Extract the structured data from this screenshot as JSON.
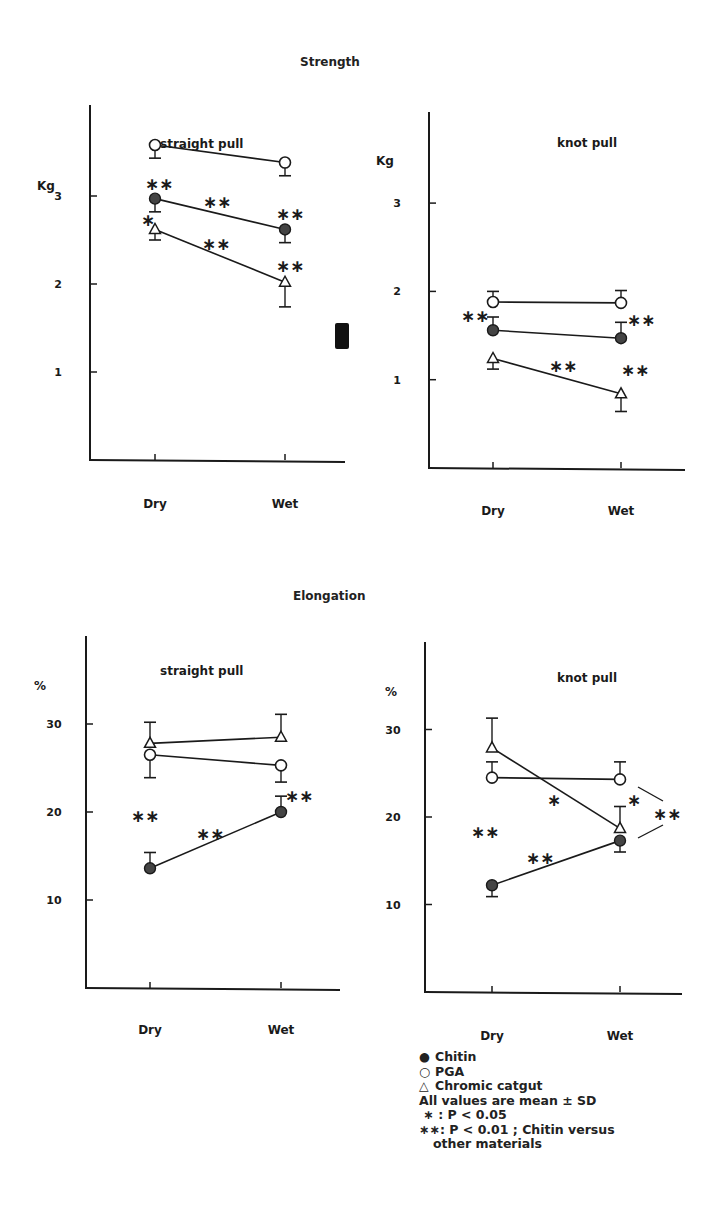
{
  "figure": {
    "sections": [
      {
        "title": "Strength",
        "title_pos": [
          300,
          55
        ]
      },
      {
        "title": "Elongation",
        "title_pos": [
          293,
          589
        ]
      }
    ],
    "artifact": {
      "type": "black-square",
      "x": 335,
      "y": 323,
      "w": 14,
      "h": 26
    }
  },
  "legend": {
    "items": [
      {
        "symbol": "●",
        "label": "Chitin"
      },
      {
        "symbol": "○",
        "label": "PGA"
      },
      {
        "symbol": "△",
        "label": "Chromic catgut"
      }
    ],
    "notes": [
      "All values are mean ± SD",
      " ∗ : P < 0.05",
      "∗∗: P < 0.01 ; Chitin versus",
      "other materials"
    ]
  },
  "colors": {
    "ink": "#1a1a1a",
    "background": "#ffffff"
  },
  "chart_data": [
    {
      "type": "line",
      "section": "Strength",
      "title": "straight pull",
      "ylabel": "Kg",
      "categories": [
        "Dry",
        "Wet"
      ],
      "yticks": [
        1,
        2,
        3
      ],
      "ylim": [
        0,
        4
      ],
      "grid": false,
      "series": [
        {
          "name": "PGA",
          "marker": "open-circle",
          "values": [
            3.58,
            3.38
          ],
          "sd": [
            0.15,
            0.15
          ],
          "sd_dir": "down"
        },
        {
          "name": "Chitin",
          "marker": "filled-circle",
          "values": [
            2.97,
            2.62
          ],
          "sd": [
            0.15,
            0.15
          ],
          "sd_dir": "down"
        },
        {
          "name": "Chromic catgut",
          "marker": "open-triangle",
          "values": [
            2.62,
            2.02
          ],
          "sd": [
            0.12,
            0.28
          ],
          "sd_dir": "down"
        }
      ],
      "annotations": [
        {
          "text": "∗∗",
          "x": 145,
          "y": 190
        },
        {
          "text": "∗∗",
          "x": 203,
          "y": 208
        },
        {
          "text": "∗∗",
          "x": 276,
          "y": 220
        },
        {
          "text": "∗",
          "x": 141,
          "y": 226
        },
        {
          "text": "∗∗",
          "x": 202,
          "y": 250
        },
        {
          "text": "∗∗",
          "x": 276,
          "y": 272
        }
      ],
      "frame": {
        "axis_x": 90,
        "y_top": 105,
        "y_zero": 460,
        "x_end": 345,
        "x_dry": 155,
        "x_wet": 285,
        "px_per_unit": 88,
        "title_x": 160,
        "title_y": 148,
        "ylabel_x": 37,
        "ylabel_y": 190,
        "cat_y": 508
      }
    },
    {
      "type": "line",
      "section": "Strength",
      "title": "knot pull",
      "ylabel": "Kg",
      "categories": [
        "Dry",
        "Wet"
      ],
      "yticks": [
        1,
        2,
        3
      ],
      "ylim": [
        0,
        4
      ],
      "grid": false,
      "series": [
        {
          "name": "PGA",
          "marker": "open-circle",
          "values": [
            1.88,
            1.87
          ],
          "sd": [
            0.12,
            0.14
          ],
          "sd_dir": "up"
        },
        {
          "name": "Chitin",
          "marker": "filled-circle",
          "values": [
            1.56,
            1.47
          ],
          "sd": [
            0.15,
            0.18
          ],
          "sd_dir": "up"
        },
        {
          "name": "Chromic catgut",
          "marker": "open-triangle",
          "values": [
            1.24,
            0.84
          ],
          "sd": [
            0.12,
            0.2
          ],
          "sd_dir": "down"
        }
      ],
      "annotations": [
        {
          "text": "∗∗",
          "x": 461,
          "y": 322
        },
        {
          "text": "∗∗",
          "x": 627,
          "y": 326
        },
        {
          "text": "∗∗",
          "x": 549,
          "y": 372
        },
        {
          "text": "∗∗",
          "x": 621,
          "y": 376
        }
      ],
      "frame": {
        "axis_x": 429,
        "y_top": 112,
        "y_zero": 468,
        "x_end": 685,
        "x_dry": 493,
        "x_wet": 621,
        "px_per_unit": 88.3,
        "title_x": 557,
        "title_y": 147,
        "ylabel_x": 376,
        "ylabel_y": 165,
        "cat_y": 515
      }
    },
    {
      "type": "line",
      "section": "Elongation",
      "title": "straight pull",
      "ylabel": "%",
      "categories": [
        "Dry",
        "Wet"
      ],
      "yticks": [
        10,
        20,
        30
      ],
      "ylim": [
        0,
        40
      ],
      "grid": false,
      "series": [
        {
          "name": "Chromic catgut",
          "marker": "open-triangle",
          "values": [
            27.8,
            28.5
          ],
          "sd": [
            2.4,
            2.6
          ],
          "sd_dir": "up"
        },
        {
          "name": "PGA",
          "marker": "open-circle",
          "values": [
            26.5,
            25.3
          ],
          "sd": [
            2.6,
            1.9
          ],
          "sd_dir": "down"
        },
        {
          "name": "Chitin",
          "marker": "filled-circle",
          "values": [
            13.6,
            20.0
          ],
          "sd": [
            1.8,
            1.8
          ],
          "sd_dir": "up"
        }
      ],
      "annotations": [
        {
          "text": "∗∗",
          "x": 131,
          "y": 822
        },
        {
          "text": "∗∗",
          "x": 196,
          "y": 840
        },
        {
          "text": "∗∗",
          "x": 285,
          "y": 802
        }
      ],
      "frame": {
        "axis_x": 86,
        "y_top": 636,
        "y_zero": 988,
        "x_end": 340,
        "x_dry": 150,
        "x_wet": 281,
        "px_per_unit": 8.8,
        "title_x": 160,
        "title_y": 675,
        "ylabel_x": 34,
        "ylabel_y": 690,
        "cat_y": 1034
      }
    },
    {
      "type": "line",
      "section": "Elongation",
      "title": "knot pull",
      "ylabel": "%",
      "categories": [
        "Dry",
        "Wet"
      ],
      "yticks": [
        10,
        20,
        30
      ],
      "ylim": [
        0,
        40
      ],
      "grid": false,
      "series": [
        {
          "name": "Chromic catgut",
          "marker": "open-triangle",
          "values": [
            27.9,
            18.7
          ],
          "sd": [
            3.4,
            2.5
          ],
          "sd_dir": "up"
        },
        {
          "name": "PGA",
          "marker": "open-circle",
          "values": [
            24.5,
            24.3
          ],
          "sd": [
            1.8,
            2.0
          ],
          "sd_dir": "up"
        },
        {
          "name": "Chitin",
          "marker": "filled-circle",
          "values": [
            12.2,
            17.3
          ],
          "sd": [
            1.3,
            1.3
          ],
          "sd_dir": "down"
        }
      ],
      "annotations": [
        {
          "text": "∗∗",
          "x": 471,
          "y": 838
        },
        {
          "text": "∗",
          "x": 547,
          "y": 806
        },
        {
          "text": "∗∗",
          "x": 526,
          "y": 864
        },
        {
          "text": "∗",
          "x": 627,
          "y": 806
        },
        {
          "text": "∗∗",
          "x": 653,
          "y": 820
        }
      ],
      "brackets": [
        {
          "x1": 638,
          "y1": 787,
          "x2": 663,
          "y2": 801
        },
        {
          "x1": 638,
          "y1": 838,
          "x2": 663,
          "y2": 825
        }
      ],
      "frame": {
        "axis_x": 425,
        "y_top": 642,
        "y_zero": 992,
        "x_end": 682,
        "x_dry": 492,
        "x_wet": 620,
        "px_per_unit": 8.75,
        "title_x": 557,
        "title_y": 682,
        "ylabel_x": 385,
        "ylabel_y": 696,
        "cat_y": 1040
      }
    }
  ]
}
